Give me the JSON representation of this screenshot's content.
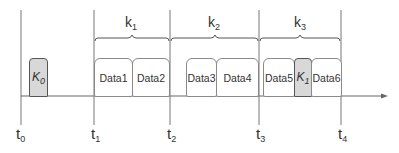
{
  "diagram": {
    "colors": {
      "line": "#666666",
      "box_border": "#8a8a8a",
      "key_fill": "#d8d8d8",
      "text": "#333333"
    },
    "time_marks": [
      {
        "base": "t",
        "sub": "0",
        "x": 21
      },
      {
        "base": "t",
        "sub": "1",
        "x": 94
      },
      {
        "base": "t",
        "sub": "2",
        "x": 170
      },
      {
        "base": "t",
        "sub": "3",
        "x": 259
      },
      {
        "base": "t",
        "sub": "4",
        "x": 341
      }
    ],
    "intervals": [
      {
        "base": "k",
        "sub": "1",
        "from": "t1",
        "to": "t2"
      },
      {
        "base": "k",
        "sub": "2",
        "from": "t2",
        "to": "t3"
      },
      {
        "base": "k",
        "sub": "3",
        "from": "t3",
        "to": "t4"
      }
    ],
    "blocks": [
      {
        "label": "K",
        "sub": "0",
        "type": "key"
      },
      {
        "label": "Data1",
        "type": "data"
      },
      {
        "label": "Data2",
        "type": "data"
      },
      {
        "label": "Data3",
        "type": "data"
      },
      {
        "label": "Data4",
        "type": "data"
      },
      {
        "label": "Data5",
        "type": "data"
      },
      {
        "label": "K",
        "sub": "1",
        "type": "key"
      },
      {
        "label": "Data6",
        "type": "data"
      }
    ]
  }
}
